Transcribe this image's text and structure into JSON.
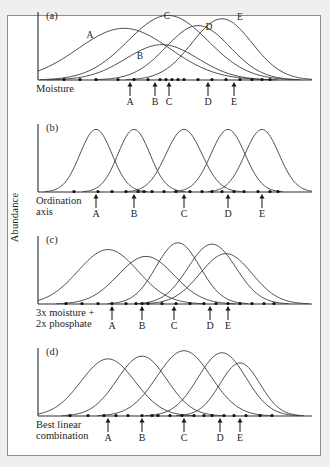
{
  "figure": {
    "y_axis_label": "Abundance",
    "panels": [
      {
        "id": "a",
        "tag": "(a)",
        "x_axis_caption": "Moisture",
        "x_axis_caption_line2": "",
        "species_labels": [
          "A",
          "B",
          "C",
          "D",
          "E"
        ],
        "arrow_labels": [
          "A",
          "B",
          "C",
          "D",
          "E"
        ]
      },
      {
        "id": "b",
        "tag": "(b)",
        "x_axis_caption": "Ordination",
        "x_axis_caption_line2": "axis",
        "species_labels": [],
        "arrow_labels": [
          "A",
          "B",
          "C",
          "D",
          "E"
        ]
      },
      {
        "id": "c",
        "tag": "(c)",
        "x_axis_caption": "3x moisture +",
        "x_axis_caption_line2": "2x phosphate",
        "species_labels": [],
        "arrow_labels": [
          "A",
          "B",
          "C",
          "D",
          "E"
        ]
      },
      {
        "id": "d",
        "tag": "(d)",
        "x_axis_caption": "Best linear",
        "x_axis_caption_line2": "combination",
        "species_labels": [],
        "arrow_labels": [
          "A",
          "B",
          "C",
          "D",
          "E"
        ]
      }
    ]
  },
  "chart_data": {
    "type": "line",
    "title": "",
    "xlabel": "",
    "ylabel": "Abundance",
    "xlim": [
      0,
      300
    ],
    "ylim": [
      0,
      1
    ],
    "grid": false,
    "legend": "none",
    "panels": [
      {
        "id": "a",
        "label": "(a)",
        "xlabel": "Moisture",
        "axis_origin_x": 26,
        "axis_right_x": 300,
        "baseline_y": 78,
        "axis_top_y": 10,
        "species": [
          {
            "name": "A",
            "mean": 112,
            "sigma": 46,
            "height": 0.76,
            "label_x": 78,
            "label_y": 36
          },
          {
            "name": "B",
            "mean": 150,
            "sigma": 36,
            "height": 0.52,
            "label_x": 128,
            "label_y": 57
          },
          {
            "name": "C",
            "mean": 156,
            "sigma": 40,
            "height": 0.95,
            "label_x": 155,
            "label_y": 17
          },
          {
            "name": "D",
            "mean": 186,
            "sigma": 32,
            "height": 0.8,
            "label_x": 197,
            "label_y": 28
          },
          {
            "name": "E",
            "mean": 210,
            "sigma": 30,
            "height": 0.9,
            "label_x": 228,
            "label_y": 18
          }
        ],
        "sample_dots": [
          52,
          68,
          84,
          106,
          122,
          136,
          148,
          154,
          160,
          166,
          172,
          186,
          200,
          214,
          228,
          240,
          250,
          258
        ],
        "arrows": [
          {
            "label": "A",
            "x": 118
          },
          {
            "label": "B",
            "x": 143
          },
          {
            "label": "C",
            "x": 157
          },
          {
            "label": "D",
            "x": 196
          },
          {
            "label": "E",
            "x": 222
          }
        ]
      },
      {
        "id": "b",
        "label": "(b)",
        "xlabel": "Ordination axis",
        "axis_origin_x": 26,
        "axis_right_x": 300,
        "baseline_y": 78,
        "axis_top_y": 10,
        "species": [
          {
            "name": "A",
            "mean": 84,
            "sigma": 16,
            "height": 0.92,
            "label_x": 0,
            "label_y": 0
          },
          {
            "name": "B",
            "mean": 122,
            "sigma": 16,
            "height": 0.92,
            "label_x": 0,
            "label_y": 0
          },
          {
            "name": "C",
            "mean": 172,
            "sigma": 18,
            "height": 0.92,
            "label_x": 0,
            "label_y": 0
          },
          {
            "name": "D",
            "mean": 216,
            "sigma": 17,
            "height": 0.92,
            "label_x": 0,
            "label_y": 0
          },
          {
            "name": "E",
            "mean": 250,
            "sigma": 17,
            "height": 0.92,
            "label_x": 0,
            "label_y": 0
          }
        ],
        "sample_dots": [
          62,
          86,
          100,
          114,
          126,
          132,
          140,
          152,
          164,
          178,
          190,
          200,
          210,
          222,
          232,
          246,
          258,
          266
        ],
        "arrows": [
          {
            "label": "A",
            "x": 84
          },
          {
            "label": "B",
            "x": 122
          },
          {
            "label": "C",
            "x": 172
          },
          {
            "label": "D",
            "x": 216
          },
          {
            "label": "E",
            "x": 250
          }
        ]
      },
      {
        "id": "c",
        "label": "(c)",
        "xlabel": "3x moisture + 2x phosphate",
        "axis_origin_x": 26,
        "axis_right_x": 300,
        "baseline_y": 78,
        "axis_top_y": 10,
        "species": [
          {
            "name": "A",
            "mean": 96,
            "sigma": 30,
            "height": 0.8,
            "label_x": 0,
            "label_y": 0
          },
          {
            "name": "B",
            "mean": 134,
            "sigma": 28,
            "height": 0.7,
            "label_x": 0,
            "label_y": 0
          },
          {
            "name": "C",
            "mean": 166,
            "sigma": 22,
            "height": 0.9,
            "label_x": 0,
            "label_y": 0
          },
          {
            "name": "D",
            "mean": 200,
            "sigma": 24,
            "height": 0.88,
            "label_x": 0,
            "label_y": 0
          },
          {
            "name": "E",
            "mean": 214,
            "sigma": 26,
            "height": 0.74,
            "label_x": 0,
            "label_y": 0
          }
        ],
        "sample_dots": [
          54,
          70,
          86,
          100,
          114,
          124,
          130,
          136,
          150,
          164,
          178,
          192,
          204,
          216,
          228,
          240,
          252,
          262
        ],
        "arrows": [
          {
            "label": "A",
            "x": 100
          },
          {
            "label": "B",
            "x": 130
          },
          {
            "label": "C",
            "x": 162
          },
          {
            "label": "D",
            "x": 198
          },
          {
            "label": "E",
            "x": 216
          }
        ]
      },
      {
        "id": "d",
        "label": "(d)",
        "xlabel": "Best linear combination",
        "axis_origin_x": 26,
        "axis_right_x": 300,
        "baseline_y": 78,
        "axis_top_y": 10,
        "species": [
          {
            "name": "A",
            "mean": 96,
            "sigma": 27,
            "height": 0.84,
            "label_x": 0,
            "label_y": 0
          },
          {
            "name": "B",
            "mean": 130,
            "sigma": 25,
            "height": 0.88,
            "label_x": 0,
            "label_y": 0
          },
          {
            "name": "C",
            "mean": 172,
            "sigma": 27,
            "height": 0.96,
            "label_x": 0,
            "label_y": 0
          },
          {
            "name": "D",
            "mean": 210,
            "sigma": 24,
            "height": 0.93,
            "label_x": 0,
            "label_y": 0
          },
          {
            "name": "E",
            "mean": 228,
            "sigma": 20,
            "height": 0.78,
            "label_x": 0,
            "label_y": 0
          }
        ],
        "sample_dots": [
          58,
          76,
          92,
          104,
          116,
          130,
          140,
          146,
          158,
          170,
          182,
          192,
          200,
          212,
          222,
          234,
          248,
          260
        ],
        "arrows": [
          {
            "label": "A",
            "x": 96
          },
          {
            "label": "B",
            "x": 130
          },
          {
            "label": "C",
            "x": 172
          },
          {
            "label": "D",
            "x": 208
          },
          {
            "label": "E",
            "x": 228
          }
        ]
      }
    ]
  }
}
